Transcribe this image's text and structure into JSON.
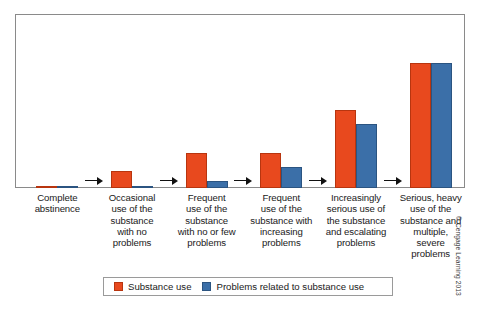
{
  "chart_data": {
    "type": "bar",
    "title": "",
    "subtitle": "",
    "xlabel": "",
    "ylabel": "",
    "ylim": [
      0,
      100
    ],
    "grid": false,
    "legend_position": "bottom-center",
    "categories": [
      "Complete abstinence",
      "Occasional use of the substance with no problems",
      "Frequent use of the substance with no or few problems",
      "Frequent use of the substance with increasing problems",
      "Increasingly serious use of the substance and escalating problems",
      "Serious, heavy use of the substance and multiple, severe problems"
    ],
    "category_lines": [
      [
        "Complete",
        "abstinence"
      ],
      [
        "Occasional",
        "use of the",
        "substance",
        "with no",
        "problems"
      ],
      [
        "Frequent",
        "use of the",
        "substance",
        "with no or few",
        "problems"
      ],
      [
        "Frequent",
        "use of the",
        "substance with",
        "increasing",
        "problems"
      ],
      [
        "Increasingly",
        "serious use of",
        "the substance",
        "and escalating",
        "problems"
      ],
      [
        "Serious, heavy",
        "use of the",
        "substance and",
        "multiple,",
        "severe",
        "problems"
      ]
    ],
    "series": [
      {
        "name": "Substance use",
        "color": "#e8491e",
        "values": [
          1,
          10,
          20,
          20,
          45,
          72
        ]
      },
      {
        "name": "Problems related to substance use",
        "color": "#3b6fa8",
        "values": [
          1,
          1,
          4,
          12,
          37,
          72
        ]
      }
    ],
    "annotations": [
      {
        "type": "arrow",
        "between": [
          0,
          1
        ]
      },
      {
        "type": "arrow",
        "between": [
          1,
          2
        ]
      },
      {
        "type": "arrow",
        "between": [
          2,
          3
        ]
      },
      {
        "type": "arrow",
        "between": [
          3,
          4
        ]
      },
      {
        "type": "arrow",
        "between": [
          4,
          5
        ]
      }
    ]
  },
  "legend": {
    "entries": [
      {
        "label": "Substance use",
        "color": "#e8491e"
      },
      {
        "label": "Problems related to substance use",
        "color": "#3b6fa8"
      }
    ]
  },
  "copyright": {
    "text": "© Cengage Learning 2013"
  },
  "colors": {
    "substance_use": "#e8491e",
    "problems": "#3b6fa8",
    "frame": "#8a8a8a",
    "text": "#1a1a1a",
    "background": "#ffffff"
  }
}
